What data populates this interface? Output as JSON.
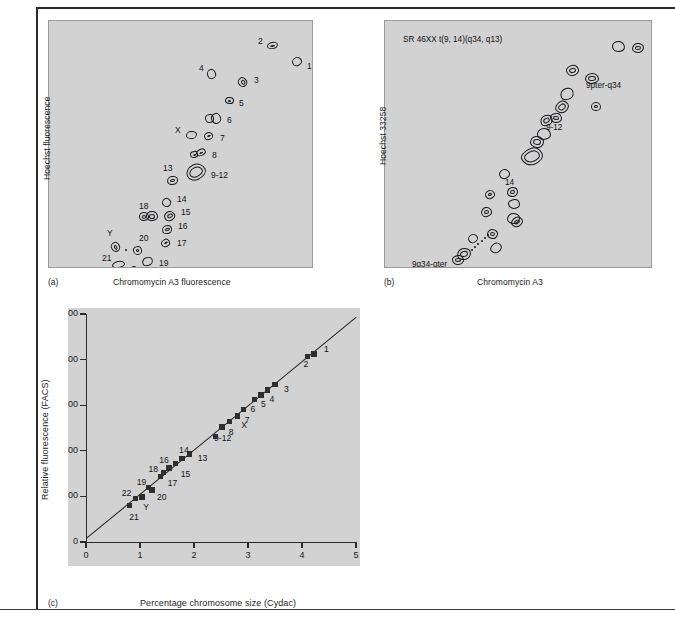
{
  "figure": {
    "panels": [
      "a",
      "b",
      "c"
    ]
  },
  "panel_a": {
    "letter": "(a)",
    "xlabel": "Chromomycin A3 fluorescence",
    "ylabel": "Hoechst fluorescence",
    "type": "bivariate-flow-karyotype",
    "marks": [
      {
        "label": "1",
        "x": 247,
        "y": 40,
        "lx": 258,
        "ly": 46
      },
      {
        "label": "2",
        "x": 222,
        "y": 24,
        "lx": 209,
        "ly": 21
      },
      {
        "label": "3",
        "x": 193,
        "y": 60,
        "lx": 205,
        "ly": 60
      },
      {
        "label": "4",
        "x": 162,
        "y": 52,
        "lx": 150,
        "ly": 48
      },
      {
        "label": "5",
        "x": 179,
        "y": 79,
        "lx": 190,
        "ly": 83
      },
      {
        "label": "6",
        "x": 166,
        "y": 96,
        "lx": 178,
        "ly": 100
      },
      {
        "label": "7",
        "x": 159,
        "y": 114,
        "lx": 171,
        "ly": 118
      },
      {
        "label": "X",
        "x": 141,
        "y": 113,
        "lx": 126,
        "ly": 110
      },
      {
        "label": "8",
        "x": 151,
        "y": 131,
        "lx": 163,
        "ly": 135
      },
      {
        "label": "9-12",
        "x": 146,
        "y": 150,
        "lx": 162,
        "ly": 155
      },
      {
        "label": "13",
        "x": 123,
        "y": 158,
        "lx": 114,
        "ly": 148
      },
      {
        "label": "14",
        "x": 117,
        "y": 180,
        "lx": 128,
        "ly": 179
      },
      {
        "label": "15",
        "x": 120,
        "y": 194,
        "lx": 132,
        "ly": 192
      },
      {
        "label": "16",
        "x": 117,
        "y": 207,
        "lx": 129,
        "ly": 206
      },
      {
        "label": "17",
        "x": 116,
        "y": 221,
        "lx": 128,
        "ly": 223
      },
      {
        "label": "18",
        "x": 102,
        "y": 194,
        "lx": 90,
        "ly": 186
      },
      {
        "label": "19",
        "x": 98,
        "y": 240,
        "lx": 110,
        "ly": 243
      },
      {
        "label": "20",
        "x": 88,
        "y": 228,
        "lx": 90,
        "ly": 218
      },
      {
        "label": "21",
        "x": 68,
        "y": 243,
        "lx": 53,
        "ly": 238
      },
      {
        "label": "22",
        "x": 84,
        "y": 249,
        "lx": 84,
        "ly": 256
      },
      {
        "label": "Y",
        "x": 65,
        "y": 225,
        "lx": 58,
        "ly": 213
      }
    ]
  },
  "panel_b": {
    "letter": "(b)",
    "xlabel": "Chromomycin A3",
    "ylabel": "Hoechst 33258",
    "header_note": "SR 46XX t(9, 14)(q34, q13)",
    "type": "bivariate-flow-karyotype",
    "annotations": [
      {
        "label": "9pter-q34",
        "lx": 585,
        "ly": 85
      },
      {
        "label": "9-12",
        "lx": 545,
        "ly": 127
      },
      {
        "label": "14",
        "lx": 504,
        "ly": 182
      },
      {
        "label": "9q34-qter",
        "lx": 411,
        "ly": 264
      }
    ]
  },
  "panel_c": {
    "letter": "(c)",
    "chart_data": {
      "type": "scatter",
      "title": "",
      "xlabel": "Percentage chromosome size (Cydac)",
      "ylabel": "Relative fluorescence (FACS)",
      "xlim": [
        0,
        5
      ],
      "ylim": [
        0,
        500
      ],
      "xticks": [
        "0",
        "1",
        "2",
        "3",
        "4",
        "5"
      ],
      "yticks": [
        "0",
        "100",
        "200",
        "300",
        "400",
        "500"
      ],
      "grid": false,
      "legend": "none",
      "fit_line": {
        "x0": 0,
        "y0": 8,
        "x1": 5,
        "y1": 493
      },
      "points": [
        {
          "label": "1",
          "x": 4.22,
          "y": 412,
          "lx": 10,
          "ly": -4
        },
        {
          "label": "2",
          "x": 4.1,
          "y": 407,
          "lx": -4,
          "ly": 9
        },
        {
          "label": "3",
          "x": 3.5,
          "y": 345,
          "lx": 9,
          "ly": 5
        },
        {
          "label": "4",
          "x": 3.36,
          "y": 333,
          "lx": 2,
          "ly": 10
        },
        {
          "label": "5",
          "x": 3.24,
          "y": 322,
          "lx": 0,
          "ly": 10
        },
        {
          "label": "6",
          "x": 3.12,
          "y": 313,
          "lx": -4,
          "ly": 11
        },
        {
          "label": "7",
          "x": 2.92,
          "y": 290,
          "lx": 1,
          "ly": 11
        },
        {
          "label": "X",
          "x": 2.8,
          "y": 276,
          "lx": 4,
          "ly": 10
        },
        {
          "label": "8",
          "x": 2.66,
          "y": 264,
          "lx": -1,
          "ly": 11
        },
        {
          "label": "9-12",
          "x": 2.52,
          "y": 252,
          "lx": -8,
          "ly": 12
        },
        {
          "label": "",
          "x": 2.4,
          "y": 232,
          "lx": 0,
          "ly": 0
        },
        {
          "label": "13",
          "x": 1.92,
          "y": 193,
          "lx": 8,
          "ly": 5
        },
        {
          "label": "14",
          "x": 1.78,
          "y": 183,
          "lx": -3,
          "ly": -8
        },
        {
          "label": "15",
          "x": 1.66,
          "y": 172,
          "lx": 5,
          "ly": 11
        },
        {
          "label": "16",
          "x": 1.54,
          "y": 162,
          "lx": -10,
          "ly": -7
        },
        {
          "label": "17",
          "x": 1.44,
          "y": 152,
          "lx": 4,
          "ly": 11
        },
        {
          "label": "18",
          "x": 1.38,
          "y": 144,
          "lx": -12,
          "ly": -6
        },
        {
          "label": "19",
          "x": 1.16,
          "y": 119,
          "lx": -12,
          "ly": -5
        },
        {
          "label": "20",
          "x": 1.22,
          "y": 114,
          "lx": 5,
          "ly": 8
        },
        {
          "label": "Y",
          "x": 1.04,
          "y": 99,
          "lx": 1,
          "ly": 11
        },
        {
          "label": "22",
          "x": 0.92,
          "y": 96,
          "lx": -14,
          "ly": -4
        },
        {
          "label": "21",
          "x": 0.8,
          "y": 80,
          "lx": 0,
          "ly": 12
        }
      ]
    }
  }
}
